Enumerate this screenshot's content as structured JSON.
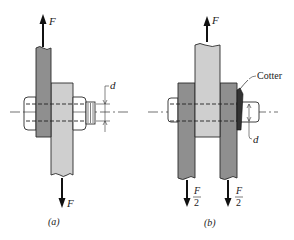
{
  "figure_a": {
    "caption": "(a)",
    "force_top": "F",
    "force_bottom": "F",
    "dimension_label": "d"
  },
  "figure_b": {
    "caption": "(b)",
    "force_top": "F",
    "force_bottom_left_num": "F",
    "force_bottom_left_den": "2",
    "force_bottom_right_num": "F",
    "force_bottom_right_den": "2",
    "cotter_label": "Cotter",
    "dimension_label": "d"
  },
  "colors": {
    "dark_plate": "#8f8f8f",
    "light_plate": "#cfcfcf",
    "outline": "#2a2a2a",
    "background": "#ffffff"
  }
}
